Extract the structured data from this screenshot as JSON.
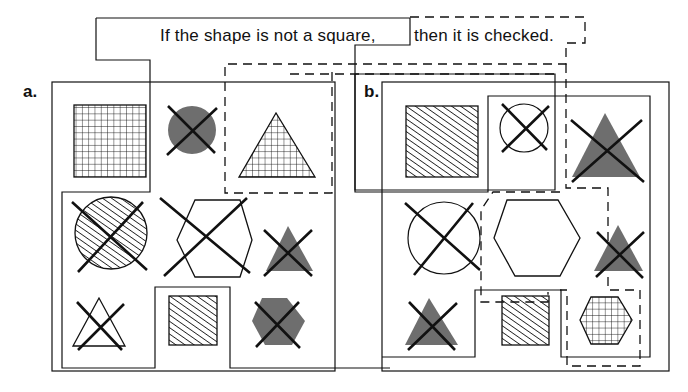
{
  "statement": {
    "antecedent": "If the shape is not a square,",
    "consequent": "then it is checked."
  },
  "panels": [
    {
      "label": "a.",
      "shapes": [
        {
          "shape": "square",
          "fill": "grid",
          "checked": false
        },
        {
          "shape": "circle",
          "fill": "solid-gray",
          "checked": true
        },
        {
          "shape": "triangle",
          "fill": "grid",
          "checked": false
        },
        {
          "shape": "circle",
          "fill": "hatched",
          "checked": true
        },
        {
          "shape": "hexagon",
          "fill": "none",
          "checked": true
        },
        {
          "shape": "triangle",
          "fill": "solid-gray",
          "checked": true
        },
        {
          "shape": "triangle",
          "fill": "none",
          "checked": true
        },
        {
          "shape": "square",
          "fill": "hatched",
          "checked": false
        },
        {
          "shape": "hexagon",
          "fill": "solid-gray",
          "checked": true
        }
      ]
    },
    {
      "label": "b.",
      "shapes": [
        {
          "shape": "square",
          "fill": "hatched",
          "checked": false
        },
        {
          "shape": "circle",
          "fill": "none",
          "checked": true
        },
        {
          "shape": "triangle",
          "fill": "solid-gray",
          "checked": true
        },
        {
          "shape": "circle",
          "fill": "none",
          "checked": true
        },
        {
          "shape": "hexagon",
          "fill": "none",
          "checked": false
        },
        {
          "shape": "triangle",
          "fill": "solid-gray",
          "checked": true
        },
        {
          "shape": "triangle",
          "fill": "solid-gray",
          "checked": true
        },
        {
          "shape": "square",
          "fill": "hatched",
          "checked": false
        },
        {
          "shape": "hexagon",
          "fill": "grid",
          "checked": false
        }
      ]
    }
  ],
  "colors": {
    "ink": "#111111",
    "gray_fill": "#6e6e6e"
  }
}
